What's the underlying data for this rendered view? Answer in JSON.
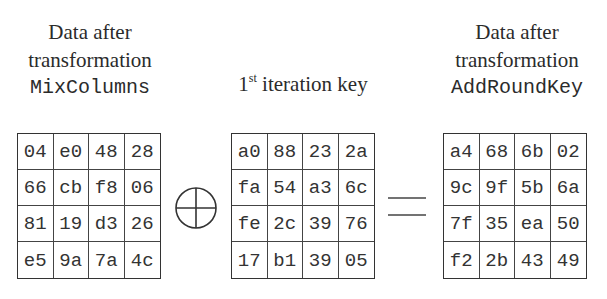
{
  "labels": {
    "left": {
      "line1": "Data after",
      "line2": "transformation",
      "line3": "MixColumns"
    },
    "middle": {
      "number": "1",
      "superscript": "st",
      "text": " iteration key"
    },
    "right": {
      "line1": "Data after",
      "line2": "transformation",
      "line3": "AddRoundKey"
    }
  },
  "operators": {
    "xor": "xor-circle-plus",
    "equals": "equals-sign"
  },
  "matrices": {
    "mixcolumns": [
      [
        "04",
        "e0",
        "48",
        "28"
      ],
      [
        "66",
        "cb",
        "f8",
        "06"
      ],
      [
        "81",
        "19",
        "d3",
        "26"
      ],
      [
        "e5",
        "9a",
        "7a",
        "4c"
      ]
    ],
    "round_key": [
      [
        "a0",
        "88",
        "23",
        "2a"
      ],
      [
        "fa",
        "54",
        "a3",
        "6c"
      ],
      [
        "fe",
        "2c",
        "39",
        "76"
      ],
      [
        "17",
        "b1",
        "39",
        "05"
      ]
    ],
    "addroundkey": [
      [
        "a4",
        "68",
        "6b",
        "02"
      ],
      [
        "9c",
        "9f",
        "5b",
        "6a"
      ],
      [
        "7f",
        "35",
        "ea",
        "50"
      ],
      [
        "f2",
        "2b",
        "43",
        "49"
      ]
    ]
  }
}
